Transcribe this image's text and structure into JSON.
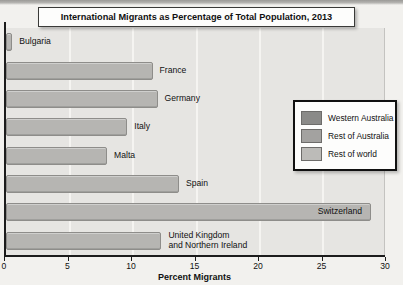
{
  "chart_data": {
    "type": "bar",
    "orientation": "horizontal",
    "title": "International Migrants as Percentage of Total Population, 2013",
    "xlabel": "Percent Migrants",
    "xlim": [
      0,
      30
    ],
    "xticks": [
      0,
      5,
      10,
      15,
      20,
      25,
      30
    ],
    "grid": "vertical light gridlines at ticks, plot area shaded",
    "legend_position": "right",
    "categories": [
      "Bulgaria",
      "France",
      "Germany",
      "Italy",
      "Malta",
      "Spain",
      "Switzerland",
      "United Kingdom\nand Northern Ireland"
    ],
    "values": [
      0.5,
      11.6,
      12.0,
      9.6,
      8.0,
      13.7,
      28.9,
      12.3
    ],
    "label_placement": [
      "outside",
      "outside",
      "outside",
      "outside",
      "outside",
      "outside",
      "inside",
      "outside"
    ],
    "series_color_key": "Rest of world"
  },
  "legend": {
    "items": [
      {
        "label": "Western Australia",
        "color": "#8a8a88"
      },
      {
        "label": "Rest of Australia",
        "color": "#a3a2a0"
      },
      {
        "label": "Rest of world",
        "color": "#bcbbb8"
      }
    ]
  },
  "colors": {
    "page_bg": "#f2f1ee",
    "plot_bg": "#e6e5e2",
    "gridline": "#f5f4f1",
    "bar_fill": "#b6b5b2",
    "bar_border": "#8e8d8a",
    "axis": "#1c1c1c"
  }
}
